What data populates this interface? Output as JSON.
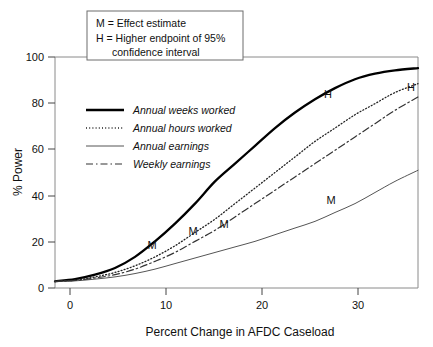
{
  "chart_data": {
    "type": "line",
    "title": "",
    "xlabel": "Percent Change in AFDC Caseload",
    "ylabel": "% Power",
    "xlim": [
      0,
      36.3
    ],
    "ylim": [
      0,
      104
    ],
    "xticks": [
      0,
      10,
      20,
      30
    ],
    "yticks": [
      0,
      20,
      40,
      60,
      80,
      100
    ],
    "xtick_labels": [
      "0",
      "10",
      "20",
      "30"
    ],
    "ytick_labels": [
      "0",
      "20",
      "40",
      "60",
      "80",
      "100"
    ],
    "grid": false,
    "legend_position": "inside-upper-left",
    "x": [
      0,
      2,
      4,
      6,
      8,
      10,
      12,
      14,
      16,
      18,
      20,
      22,
      24,
      26,
      28,
      30,
      32,
      34,
      36.3
    ],
    "series": [
      {
        "name": "Annual weeks worked",
        "style": "thick-solid",
        "color": "#000000",
        "values": [
          3,
          4,
          6,
          9,
          14,
          21,
          29,
          38,
          48,
          56,
          64,
          72,
          79,
          85,
          90,
          94,
          96.5,
          98,
          99
        ]
      },
      {
        "name": "Annual hours worked",
        "style": "dotted",
        "color": "#222222",
        "values": [
          3,
          3.5,
          5,
          7,
          10,
          14,
          19,
          25,
          31,
          38,
          45,
          52,
          59,
          66,
          72,
          78,
          83,
          88,
          92
        ]
      },
      {
        "name": "Annual earnings",
        "style": "thin-solid",
        "color": "#555555",
        "values": [
          3,
          3.2,
          4,
          5,
          6.5,
          8.5,
          11,
          13.5,
          16,
          18.5,
          21,
          24,
          27,
          30,
          34,
          38,
          43,
          48,
          53
        ]
      },
      {
        "name": "Weekly earnings",
        "style": "dash-dot",
        "color": "#333333",
        "values": [
          3,
          3.4,
          4.5,
          6,
          8.5,
          12,
          16,
          21,
          26,
          32,
          38,
          44,
          50,
          56,
          62,
          68,
          74,
          80,
          86
        ]
      }
    ],
    "annotations": [
      {
        "label": "M",
        "series": "Annual weeks worked",
        "x": 9.7,
        "y": 19.5
      },
      {
        "label": "M",
        "series": "Annual hours worked",
        "x": 13.8,
        "y": 25.5
      },
      {
        "label": "M",
        "series": "Weekly earnings",
        "x": 16.9,
        "y": 29.0
      },
      {
        "label": "M",
        "series": "Annual earnings",
        "x": 27.6,
        "y": 39.5
      },
      {
        "label": "H",
        "series": "Annual weeks worked",
        "x": 27.3,
        "y": 87.5
      },
      {
        "label": "H",
        "series": "Annual hours worked",
        "x": 35.6,
        "y": 90.5
      }
    ]
  },
  "note_box": {
    "lines": [
      "M = Effect estimate",
      "H = Higher endpoint of 95%",
      "confidence interval"
    ]
  },
  "legend": {
    "entries": [
      {
        "label": "Annual weeks worked"
      },
      {
        "label": "Annual hours worked"
      },
      {
        "label": "Annual earnings"
      },
      {
        "label": "Weekly earnings"
      }
    ]
  }
}
